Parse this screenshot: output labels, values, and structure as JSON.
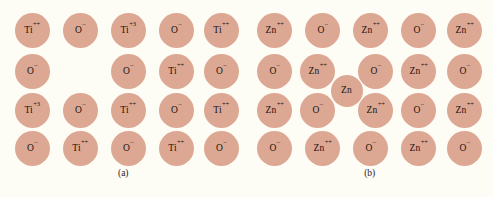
{
  "figure": {
    "background_color": "#fdfcf5",
    "ion_color": "#dda893",
    "text_color": "#1a1310"
  },
  "panels": [
    {
      "id": "a",
      "caption": "(a)",
      "caption_x": 120,
      "caption_y": 168,
      "geometry": {
        "radius": 17.5,
        "col_x": [
          32,
          80,
          128,
          176,
          221
        ],
        "row_y": [
          30,
          71,
          110,
          148
        ]
      },
      "ions": [
        {
          "name": "ion-a-r1c1",
          "symbol": "Ti",
          "charge": "++",
          "col": 0,
          "row": 0,
          "kind": "cation"
        },
        {
          "name": "ion-a-r1c2",
          "symbol": "O",
          "charge": "–",
          "col": 1,
          "row": 0,
          "kind": "anion"
        },
        {
          "name": "ion-a-r1c3",
          "symbol": "Ti",
          "charge": "+3",
          "col": 2,
          "row": 0,
          "kind": "cation-reduced"
        },
        {
          "name": "ion-a-r1c4",
          "symbol": "O",
          "charge": "–",
          "col": 3,
          "row": 0,
          "kind": "anion"
        },
        {
          "name": "ion-a-r1c5",
          "symbol": "Ti",
          "charge": "++",
          "col": 4,
          "row": 0,
          "kind": "cation"
        },
        {
          "name": "ion-a-r2c1",
          "symbol": "O",
          "charge": "–",
          "col": 0,
          "row": 1,
          "kind": "anion"
        },
        {
          "name": "ion-a-r2c2-vacancy",
          "symbol": "",
          "charge": "",
          "col": 1,
          "row": 1,
          "kind": "vacancy"
        },
        {
          "name": "ion-a-r2c3",
          "symbol": "O",
          "charge": "–",
          "col": 2,
          "row": 1,
          "kind": "anion"
        },
        {
          "name": "ion-a-r2c4",
          "symbol": "Ti",
          "charge": "++",
          "col": 3,
          "row": 1,
          "kind": "cation"
        },
        {
          "name": "ion-a-r2c5",
          "symbol": "O",
          "charge": "–",
          "col": 4,
          "row": 1,
          "kind": "anion"
        },
        {
          "name": "ion-a-r3c1",
          "symbol": "Ti",
          "charge": "+3",
          "col": 0,
          "row": 2,
          "kind": "cation-reduced"
        },
        {
          "name": "ion-a-r3c2",
          "symbol": "O",
          "charge": "–",
          "col": 1,
          "row": 2,
          "kind": "anion"
        },
        {
          "name": "ion-a-r3c3",
          "symbol": "Ti",
          "charge": "++",
          "col": 2,
          "row": 2,
          "kind": "cation"
        },
        {
          "name": "ion-a-r3c4",
          "symbol": "O",
          "charge": "–",
          "col": 3,
          "row": 2,
          "kind": "anion"
        },
        {
          "name": "ion-a-r3c5",
          "symbol": "Ti",
          "charge": "++",
          "col": 4,
          "row": 2,
          "kind": "cation"
        },
        {
          "name": "ion-a-r4c1",
          "symbol": "O",
          "charge": "–",
          "col": 0,
          "row": 3,
          "kind": "anion"
        },
        {
          "name": "ion-a-r4c2",
          "symbol": "Ti",
          "charge": "++",
          "col": 1,
          "row": 3,
          "kind": "cation"
        },
        {
          "name": "ion-a-r4c3",
          "symbol": "O",
          "charge": "–",
          "col": 2,
          "row": 3,
          "kind": "anion"
        },
        {
          "name": "ion-a-r4c4",
          "symbol": "Ti",
          "charge": "++",
          "col": 3,
          "row": 3,
          "kind": "cation"
        },
        {
          "name": "ion-a-r4c5",
          "symbol": "O",
          "charge": "–",
          "col": 4,
          "row": 3,
          "kind": "anion"
        }
      ]
    },
    {
      "id": "b",
      "caption": "(b)",
      "caption_x": 120,
      "caption_y": 168,
      "geometry": {
        "radius": 17.5,
        "col_x": [
          28,
          76,
          124,
          172,
          218
        ],
        "row_y": [
          30,
          71,
          110,
          148
        ]
      },
      "ions": [
        {
          "name": "ion-b-r1c1",
          "symbol": "Zn",
          "charge": "++",
          "col": 0,
          "row": 0,
          "kind": "cation"
        },
        {
          "name": "ion-b-r1c2",
          "symbol": "O",
          "charge": "–",
          "col": 1,
          "row": 0,
          "kind": "anion"
        },
        {
          "name": "ion-b-r1c3",
          "symbol": "Zn",
          "charge": "++",
          "col": 2,
          "row": 0,
          "kind": "cation"
        },
        {
          "name": "ion-b-r1c4",
          "symbol": "O",
          "charge": "–",
          "col": 3,
          "row": 0,
          "kind": "anion"
        },
        {
          "name": "ion-b-r1c5",
          "symbol": "Zn",
          "charge": "++",
          "col": 4,
          "row": 0,
          "kind": "cation"
        },
        {
          "name": "ion-b-r2c1",
          "symbol": "O",
          "charge": "–",
          "col": 0,
          "row": 1,
          "kind": "anion"
        },
        {
          "name": "ion-b-r2c2",
          "symbol": "Zn",
          "charge": "++",
          "col": 1,
          "row": 1,
          "kind": "cation",
          "dx": -5
        },
        {
          "name": "ion-b-r2c3",
          "symbol": "O",
          "charge": "–",
          "col": 2,
          "row": 1,
          "kind": "anion",
          "dx": 5
        },
        {
          "name": "ion-b-r2c4",
          "symbol": "Zn",
          "charge": "++",
          "col": 3,
          "row": 1,
          "kind": "cation"
        },
        {
          "name": "ion-b-r2c5",
          "symbol": "O",
          "charge": "–",
          "col": 4,
          "row": 1,
          "kind": "anion"
        },
        {
          "name": "ion-b-r3c1",
          "symbol": "Zn",
          "charge": "++",
          "col": 0,
          "row": 2,
          "kind": "cation"
        },
        {
          "name": "ion-b-r3c2",
          "symbol": "O",
          "charge": "–",
          "col": 1,
          "row": 2,
          "kind": "anion",
          "dx": -5
        },
        {
          "name": "ion-b-r3c3",
          "symbol": "Zn",
          "charge": "++",
          "col": 2,
          "row": 2,
          "kind": "cation",
          "dx": 5
        },
        {
          "name": "ion-b-r3c4",
          "symbol": "O",
          "charge": "–",
          "col": 3,
          "row": 2,
          "kind": "anion"
        },
        {
          "name": "ion-b-r3c5",
          "symbol": "Zn",
          "charge": "++",
          "col": 4,
          "row": 2,
          "kind": "cation"
        },
        {
          "name": "ion-b-r4c1",
          "symbol": "O",
          "charge": "–",
          "col": 0,
          "row": 3,
          "kind": "anion"
        },
        {
          "name": "ion-b-r4c2",
          "symbol": "Zn",
          "charge": "++",
          "col": 1,
          "row": 3,
          "kind": "cation"
        },
        {
          "name": "ion-b-r4c3",
          "symbol": "O",
          "charge": "–",
          "col": 2,
          "row": 3,
          "kind": "anion"
        },
        {
          "name": "ion-b-r4c4",
          "symbol": "Zn",
          "charge": "++",
          "col": 3,
          "row": 3,
          "kind": "cation"
        },
        {
          "name": "ion-b-r4c5",
          "symbol": "O",
          "charge": "–",
          "col": 4,
          "row": 3,
          "kind": "anion"
        }
      ],
      "interstitial": {
        "name": "ion-b-interstitial-zn",
        "symbol": "Zn",
        "charge": "",
        "x": 100,
        "y": 91,
        "radius": 16,
        "kind": "interstitial"
      }
    }
  ]
}
